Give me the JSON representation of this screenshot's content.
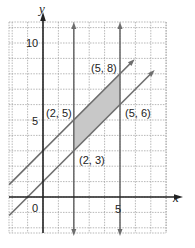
{
  "chart_data": {
    "type": "line",
    "title": "",
    "xlabel": "x",
    "ylabel": "y",
    "xlim": [
      -1.9,
      6.8
    ],
    "ylim": [
      -1.9,
      11.5
    ],
    "grid": true,
    "tick_labels": {
      "x": [
        "0",
        "5"
      ],
      "y": [
        "5",
        "10"
      ]
    },
    "lines": [
      {
        "name": "x = 2",
        "type": "vertical",
        "x": 2
      },
      {
        "name": "x = 5",
        "type": "vertical",
        "x": 5
      },
      {
        "name": "y = x + 3",
        "slope": 1,
        "intercept": 3
      },
      {
        "name": "y = x + 1",
        "slope": 1,
        "intercept": 1
      }
    ],
    "shaded_region": {
      "vertices": [
        [
          2,
          3
        ],
        [
          2,
          5
        ],
        [
          5,
          8
        ],
        [
          5,
          6
        ]
      ],
      "color": "#c8c8c8"
    },
    "annotations": [
      {
        "text": "(2, 5)",
        "x": 2,
        "y": 5
      },
      {
        "text": "(5, 8)",
        "x": 5,
        "y": 8
      },
      {
        "text": "(5, 6)",
        "x": 5,
        "y": 6
      },
      {
        "text": "(2, 3)",
        "x": 2,
        "y": 3
      }
    ],
    "colors": {
      "axes": "#222222",
      "lines": "#6e6e6e",
      "grid": "#9a9a9a",
      "shade": "#c8c8c8"
    }
  },
  "labels": {
    "x_axis": "x",
    "y_axis": "y",
    "origin": "0",
    "x5": "5",
    "y5": "5",
    "y10": "10",
    "p25": "(2, 5)",
    "p58": "(5, 8)",
    "p56": "(5, 6)",
    "p23": "(2, 3)"
  }
}
